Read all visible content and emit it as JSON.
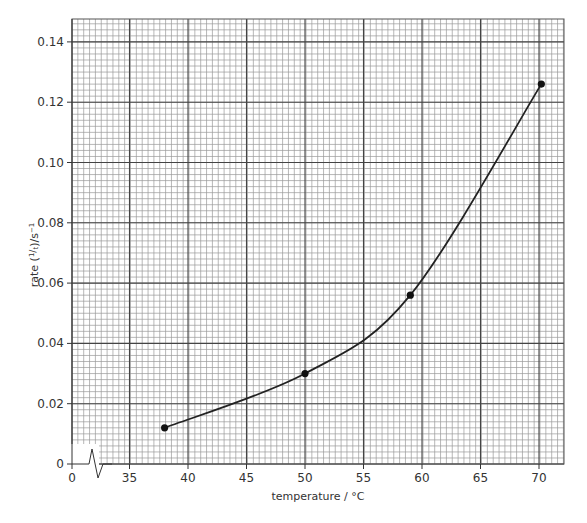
{
  "chart_data": {
    "type": "line",
    "title": "",
    "xlabel": "temperature / °C",
    "ylabel": "rate (1/t) / s⁻¹",
    "x_tick_labels": [
      "0",
      "35",
      "40",
      "45",
      "50",
      "55",
      "60",
      "65",
      "70"
    ],
    "y_tick_labels": [
      "0",
      "0.02",
      "0.04",
      "0.06",
      "0.08",
      "0.10",
      "0.12",
      "0.14"
    ],
    "x_axis_break": true,
    "xlim": [
      30,
      72.3
    ],
    "ylim": [
      0,
      0.148
    ],
    "grid": true,
    "legend": null,
    "series": [
      {
        "name": "rate",
        "x": [
          38,
          50,
          59,
          70.2
        ],
        "y": [
          0.012,
          0.03,
          0.056,
          0.126
        ],
        "markers": true,
        "smooth_curve": true
      }
    ]
  },
  "labels": {
    "xlabel": "temperature / °C",
    "ylabel_prefix": "rate (",
    "ylabel_num": "1",
    "ylabel_den": "t",
    "ylabel_suffix": ")/s",
    "ylabel_exp": "−1"
  }
}
